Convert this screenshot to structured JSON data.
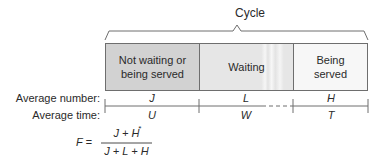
{
  "diagram": {
    "title": "Cycle",
    "segments": [
      {
        "label": "Not waiting or being served",
        "lines": [
          "Not waiting or",
          "being served"
        ],
        "fill": "#d2d2d2"
      },
      {
        "label": "Waiting",
        "lines": [
          "Waiting"
        ],
        "fill": "#e6e6e6"
      },
      {
        "label": "Being served",
        "lines": [
          "Being",
          "served"
        ],
        "fill": "#f7f7f7"
      }
    ],
    "rows": {
      "number_label": "Average number:",
      "time_label": "Average time:"
    },
    "variables": {
      "number": [
        "J",
        "L",
        "H"
      ],
      "time": [
        "U",
        "W",
        "T"
      ]
    },
    "formula": {
      "lhs": "F =",
      "numerator": "J + H",
      "denominator": "J + L + H",
      "asterisk": "*"
    },
    "colors": {
      "line": "#6e6e6e",
      "text": "#2a2a2a"
    }
  }
}
